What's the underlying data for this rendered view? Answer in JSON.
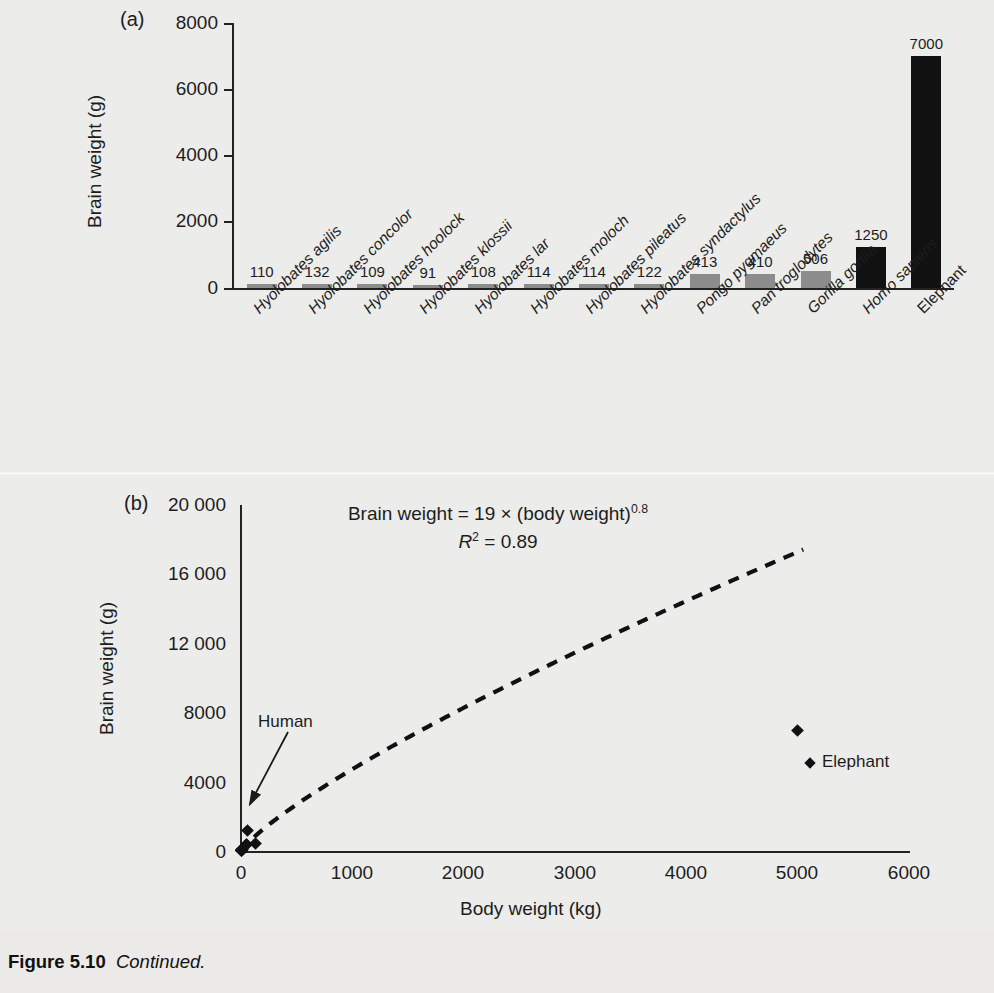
{
  "figure": {
    "caption_label": "Figure 5.10",
    "caption_text": "Continued."
  },
  "panel_a": {
    "tag": "(a)",
    "ylabel": "Brain weight (g)",
    "yticks": [
      "8000",
      "6000",
      "4000",
      "2000",
      "0"
    ]
  },
  "panel_b": {
    "tag": "(b)",
    "ylabel": "Brain weight (g)",
    "xlabel": "Body weight (kg)",
    "yticks": [
      "20 000",
      "16 000",
      "12 000",
      "8000",
      "4000",
      "0"
    ],
    "xticks": [
      "0",
      "1000",
      "2000",
      "3000",
      "4000",
      "5000",
      "6000"
    ],
    "equation_line1_prefix": "Brain weight = 19 × (body weight)",
    "equation_exponent": "0.8",
    "equation_line2_var": "R",
    "equation_line2_sup": "2",
    "equation_line2_rest": " = 0.89",
    "human_annotation": "Human",
    "elephant_legend": "Elephant"
  },
  "chart_data": [
    {
      "type": "bar",
      "title": "(a)",
      "xlabel": "",
      "ylabel": "Brain weight (g)",
      "ylim": [
        0,
        8000
      ],
      "yticks": [
        0,
        2000,
        4000,
        6000,
        8000
      ],
      "grid": false,
      "legend": "none",
      "categories": [
        "Hyolobates agilis",
        "Hyolobates concolor",
        "Hyolobates hoolock",
        "Hyolobates klossii",
        "Hyolobates lar",
        "Hyolobates moloch",
        "Hyolobates pileatus",
        "Hyolobates syndactylus",
        "Pongo pygmaeus",
        "Pan troglodytes",
        "Gorilla gorilla",
        "Homo sapiens",
        "Elephant"
      ],
      "category_styles": [
        "italic",
        "italic",
        "italic",
        "italic",
        "italic",
        "italic",
        "italic",
        "italic",
        "italic",
        "italic",
        "italic",
        "italic",
        "upright"
      ],
      "values": [
        110,
        132,
        109,
        91,
        108,
        114,
        114,
        122,
        413,
        410,
        506,
        1250,
        7000
      ],
      "value_labels": [
        "110",
        "132",
        "109",
        "91",
        "108",
        "114",
        "114",
        "122",
        "413",
        "410",
        "506",
        "1250",
        "7000"
      ],
      "bar_colors": [
        "#8c8c8c",
        "#8c8c8c",
        "#8c8c8c",
        "#8c8c8c",
        "#8c8c8c",
        "#8c8c8c",
        "#8c8c8c",
        "#8c8c8c",
        "#8c8c8c",
        "#8c8c8c",
        "#8c8c8c",
        "#111111",
        "#111111"
      ],
      "colors": {
        "primate_bar": "#8c8c8c",
        "highlight_bar": "#111111"
      }
    },
    {
      "type": "scatter",
      "title": "(b)",
      "xlabel": "Body weight (kg)",
      "ylabel": "Brain weight (g)",
      "xlim": [
        0,
        6000
      ],
      "ylim": [
        0,
        20000
      ],
      "xticks": [
        0,
        1000,
        2000,
        3000,
        4000,
        5000,
        6000
      ],
      "yticks": [
        0,
        4000,
        8000,
        12000,
        16000,
        20000
      ],
      "grid": false,
      "legend": "inline",
      "annotations": [
        {
          "text": "Brain weight = 19 × (body weight)0.8",
          "kind": "equation"
        },
        {
          "text": "R2 = 0.89",
          "kind": "equation"
        },
        {
          "text": "Human",
          "kind": "arrow-label",
          "points_to": [
            60,
            1250
          ]
        },
        {
          "text": "Elephant",
          "kind": "point-label",
          "points_to": [
            5000,
            7000
          ]
        }
      ],
      "points": [
        {
          "label": "Hyolobates agilis",
          "x": 5.8,
          "y": 110
        },
        {
          "label": "Hyolobates concolor",
          "x": 7.5,
          "y": 132
        },
        {
          "label": "Hyolobates hoolock",
          "x": 6.9,
          "y": 109
        },
        {
          "label": "Hyolobates klossii",
          "x": 5.7,
          "y": 91
        },
        {
          "label": "Hyolobates lar",
          "x": 5.5,
          "y": 108
        },
        {
          "label": "Hyolobates moloch",
          "x": 5.8,
          "y": 114
        },
        {
          "label": "Hyolobates pileatus",
          "x": 5.5,
          "y": 114
        },
        {
          "label": "Hyolobates syndactylus",
          "x": 10.7,
          "y": 122
        },
        {
          "label": "Pongo pygmaeus",
          "x": 53,
          "y": 413
        },
        {
          "label": "Pan troglodytes",
          "x": 46,
          "y": 410
        },
        {
          "label": "Gorilla gorilla",
          "x": 126,
          "y": 506
        },
        {
          "label": "Homo sapiens",
          "x": 60,
          "y": 1250
        },
        {
          "label": "Elephant",
          "x": 5000,
          "y": 7000
        }
      ],
      "fit_curve": {
        "style": "dashed",
        "equation": "y = 19 * x^0.8",
        "coefficient": 19,
        "exponent": 0.8,
        "r_squared": 0.89,
        "x_range": [
          0,
          5050
        ]
      }
    }
  ]
}
